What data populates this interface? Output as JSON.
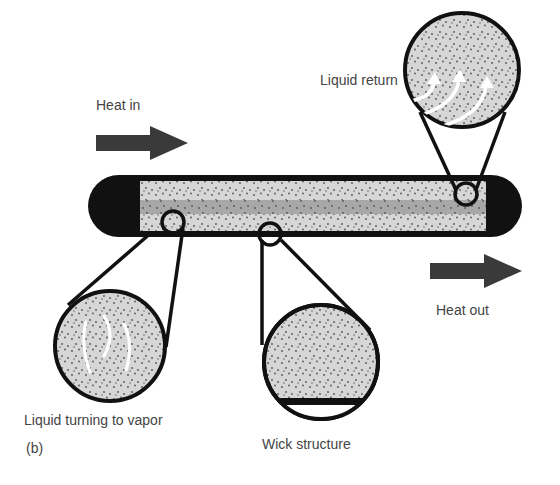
{
  "diagram": {
    "panel_label": "(b)",
    "labels": {
      "heat_in": "Heat in",
      "heat_out": "Heat out",
      "liquid_return": "Liquid return",
      "liquid_turning_to_vapor": "Liquid turning to vapor",
      "wick_structure": "Wick structure"
    },
    "colors": {
      "outline": "#111111",
      "wick_fill": "#d6d6d6",
      "vapor_core": "#a8a8a8",
      "arrow": "#3a3a3a",
      "dots": "#555555",
      "text": "#444444"
    }
  }
}
